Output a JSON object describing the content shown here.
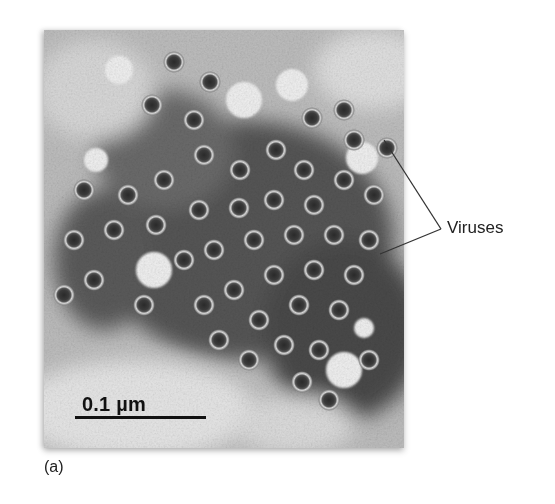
{
  "figure": {
    "panel_label": "(a)",
    "micrograph": {
      "description": "electron micrograph of virus particles",
      "scale_bar_label": "0.1 µm"
    },
    "callout": {
      "label": "Viruses",
      "pointer_count": 2
    }
  }
}
